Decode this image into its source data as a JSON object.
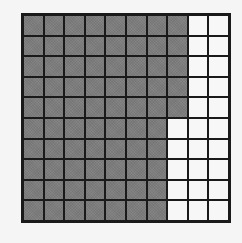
{
  "figure": {
    "type": "hundred-grid",
    "rows": 10,
    "columns": 10,
    "shaded_per_row": [
      8,
      8,
      8,
      8,
      8,
      7,
      7,
      7,
      7,
      7
    ],
    "shaded_total": 75,
    "unshaded_total": 25,
    "colors": {
      "shaded": "#7d7d7d",
      "unshaded": "#f7f7f7",
      "grid_lines": "#1a1a1a",
      "background": "#f5f5f5"
    }
  }
}
